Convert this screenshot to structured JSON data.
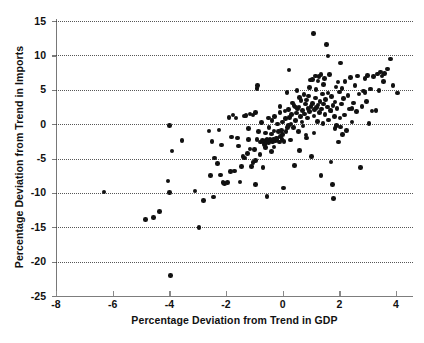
{
  "figure": {
    "background": "#ffffff",
    "ink_color": "#111111",
    "axis_color": "#7a7a7a",
    "grid_color": "#3a3a3a"
  },
  "chart_data": {
    "type": "scatter",
    "title": "",
    "xlabel": "Percentage Deviation from Trend in GDP",
    "ylabel": "Percentage Deviation from Trend in Imports",
    "xlim": [
      -8,
      4.6
    ],
    "ylim": [
      -25,
      15
    ],
    "xticks": [
      -8,
      -6,
      -4,
      -2,
      0,
      2,
      4
    ],
    "xtick_labels": [
      "-8",
      "-6",
      "-4",
      "-2",
      "0",
      "2",
      "4"
    ],
    "yticks": [
      15,
      10,
      5,
      0,
      -5,
      -10,
      -15,
      -20,
      -25
    ],
    "ytick_labels": [
      "15",
      "10",
      "5",
      "0",
      "-5",
      "-10",
      "-15",
      "-20",
      "-25"
    ],
    "grid": "horizontal-dotted",
    "gridlines_y": [
      15,
      10,
      5,
      0,
      -5,
      -10,
      -15,
      -20
    ],
    "legend": null,
    "marker": "filled-circle",
    "marker_color": "#111111",
    "n_points": 223,
    "points": [
      [
        -6.3,
        -9.9
      ],
      [
        -4.85,
        -13.9
      ],
      [
        -4.55,
        -13.6
      ],
      [
        -4.35,
        -12.7
      ],
      [
        -4.05,
        -8.3
      ],
      [
        -4.0,
        -0.2
      ],
      [
        -4.0,
        -9.95
      ],
      [
        -3.95,
        -22.0
      ],
      [
        -3.9,
        -3.9
      ],
      [
        -3.55,
        -2.4
      ],
      [
        -3.1,
        -9.7
      ],
      [
        -2.95,
        -15.0
      ],
      [
        -2.8,
        -11.1
      ],
      [
        -2.6,
        -1.0
      ],
      [
        -2.55,
        -7.5
      ],
      [
        -2.5,
        -2.5
      ],
      [
        -2.45,
        -10.6
      ],
      [
        -2.3,
        -5.7
      ],
      [
        -2.25,
        -0.85
      ],
      [
        -2.2,
        -7.4
      ],
      [
        -2.15,
        -3.05
      ],
      [
        -2.1,
        -8.5
      ],
      [
        -2.05,
        -8.6
      ],
      [
        -1.95,
        -8.5
      ],
      [
        -1.85,
        -6.9
      ],
      [
        -1.8,
        -1.85
      ],
      [
        -1.75,
        1.3
      ],
      [
        -1.7,
        -6.8
      ],
      [
        -1.65,
        0.9
      ],
      [
        -1.55,
        -3.2
      ],
      [
        -1.5,
        -8.4
      ],
      [
        -1.45,
        -6.2
      ],
      [
        -1.4,
        -4.7
      ],
      [
        -1.35,
        1.2
      ],
      [
        -1.3,
        1.25
      ],
      [
        -1.25,
        -4.3
      ],
      [
        -1.2,
        -0.6
      ],
      [
        -1.2,
        -2.2
      ],
      [
        -1.15,
        1.5
      ],
      [
        -1.1,
        -6.2
      ],
      [
        -1.05,
        1.35
      ],
      [
        -1.0,
        -3.7
      ],
      [
        -0.95,
        -8.8
      ],
      [
        -0.95,
        1.65
      ],
      [
        -0.9,
        -2.2
      ],
      [
        -0.9,
        5.2
      ],
      [
        -0.88,
        5.6
      ],
      [
        -0.85,
        -1.1
      ],
      [
        -0.8,
        -4.4
      ],
      [
        -0.78,
        -2.6
      ],
      [
        -0.75,
        0.2
      ],
      [
        -0.72,
        -2.4
      ],
      [
        -0.7,
        -6.3
      ],
      [
        -0.68,
        -2.55
      ],
      [
        -0.65,
        -3.0
      ],
      [
        -0.62,
        -2.9
      ],
      [
        -0.6,
        -1.3
      ],
      [
        -0.58,
        -2.3
      ],
      [
        -0.55,
        -10.5
      ],
      [
        -0.55,
        -2.2
      ],
      [
        -0.5,
        -2.7
      ],
      [
        -0.48,
        -0.5
      ],
      [
        -0.45,
        -2.15
      ],
      [
        -0.42,
        -2.4
      ],
      [
        -0.4,
        -1.45
      ],
      [
        -0.38,
        0.5
      ],
      [
        -0.35,
        -2.6
      ],
      [
        -0.32,
        -2.2
      ],
      [
        -0.3,
        -1.0
      ],
      [
        -0.28,
        1.1
      ],
      [
        -0.25,
        -2.4
      ],
      [
        -0.22,
        -2.0
      ],
      [
        -0.2,
        -2.2
      ],
      [
        -0.18,
        0.0
      ],
      [
        -0.15,
        -1.1
      ],
      [
        -0.12,
        -2.6
      ],
      [
        -0.1,
        2.6
      ],
      [
        -0.08,
        -1.8
      ],
      [
        -0.05,
        -0.9
      ],
      [
        -0.02,
        -2.2
      ],
      [
        0.0,
        -1.55
      ],
      [
        0.0,
        0.3
      ],
      [
        0.02,
        -9.3
      ],
      [
        0.05,
        -2.5
      ],
      [
        0.08,
        1.9
      ],
      [
        0.1,
        0.8
      ],
      [
        0.12,
        -1.1
      ],
      [
        0.15,
        4.6
      ],
      [
        0.18,
        -0.45
      ],
      [
        0.2,
        2.1
      ],
      [
        0.22,
        7.9
      ],
      [
        0.25,
        1.0
      ],
      [
        0.28,
        -2.3
      ],
      [
        0.3,
        0.0
      ],
      [
        0.32,
        1.4
      ],
      [
        0.35,
        3.1
      ],
      [
        0.38,
        -0.5
      ],
      [
        0.4,
        2.7
      ],
      [
        0.42,
        -6.0
      ],
      [
        0.45,
        0.55
      ],
      [
        0.48,
        1.6
      ],
      [
        0.5,
        4.9
      ],
      [
        0.52,
        2.2
      ],
      [
        0.55,
        -1.1
      ],
      [
        0.58,
        2.5
      ],
      [
        0.6,
        -3.8
      ],
      [
        0.62,
        1.15
      ],
      [
        0.65,
        3.4
      ],
      [
        0.68,
        0.3
      ],
      [
        0.7,
        2.0
      ],
      [
        0.72,
        -0.3
      ],
      [
        0.75,
        4.3
      ],
      [
        0.78,
        1.5
      ],
      [
        0.8,
        2.9
      ],
      [
        0.82,
        -1.6
      ],
      [
        0.85,
        3.5
      ],
      [
        0.88,
        0.9
      ],
      [
        0.9,
        2.3
      ],
      [
        0.92,
        4.1
      ],
      [
        0.95,
        1.8
      ],
      [
        0.98,
        6.4
      ],
      [
        1.0,
        2.6
      ],
      [
        1.02,
        -4.7
      ],
      [
        1.05,
        3.0
      ],
      [
        1.08,
        13.2
      ],
      [
        1.1,
        1.2
      ],
      [
        1.12,
        2.1
      ],
      [
        1.15,
        3.8
      ],
      [
        1.18,
        5.0
      ],
      [
        1.2,
        2.4
      ],
      [
        1.22,
        0.4
      ],
      [
        1.25,
        2.8
      ],
      [
        1.28,
        6.9
      ],
      [
        1.3,
        1.7
      ],
      [
        1.32,
        3.3
      ],
      [
        1.35,
        -7.5
      ],
      [
        1.38,
        2.2
      ],
      [
        1.4,
        4.4
      ],
      [
        1.42,
        0.1
      ],
      [
        1.45,
        2.9
      ],
      [
        1.48,
        6.6
      ],
      [
        1.5,
        1.4
      ],
      [
        1.52,
        3.6
      ],
      [
        1.55,
        11.6
      ],
      [
        1.58,
        2.5
      ],
      [
        1.6,
        9.9
      ],
      [
        1.62,
        0.6
      ],
      [
        1.65,
        7.2
      ],
      [
        1.68,
        2.0
      ],
      [
        1.7,
        -5.5
      ],
      [
        1.72,
        4.0
      ],
      [
        1.75,
        -8.8
      ],
      [
        1.78,
        2.7
      ],
      [
        1.8,
        -10.8
      ],
      [
        1.82,
        1.1
      ],
      [
        1.85,
        3.2
      ],
      [
        1.88,
        5.4
      ],
      [
        1.9,
        -0.2
      ],
      [
        1.92,
        2.3
      ],
      [
        1.95,
        6.1
      ],
      [
        1.98,
        -2.6
      ],
      [
        2.0,
        4.7
      ],
      [
        2.02,
        0.9
      ],
      [
        2.05,
        8.9
      ],
      [
        2.08,
        2.9
      ],
      [
        2.1,
        5.2
      ],
      [
        2.12,
        -1.5
      ],
      [
        2.15,
        3.7
      ],
      [
        2.18,
        1.3
      ],
      [
        2.2,
        6.2
      ],
      [
        2.25,
        -0.9
      ],
      [
        2.3,
        4.2
      ],
      [
        2.35,
        2.2
      ],
      [
        2.4,
        6.8
      ],
      [
        2.45,
        0.3
      ],
      [
        2.5,
        3.1
      ],
      [
        2.55,
        5.6
      ],
      [
        2.6,
        1.8
      ],
      [
        2.65,
        7.0
      ],
      [
        2.7,
        4.4
      ],
      [
        2.75,
        -6.3
      ],
      [
        2.8,
        2.6
      ],
      [
        2.85,
        4.8
      ],
      [
        2.9,
        6.6
      ],
      [
        2.95,
        3.3
      ],
      [
        3.0,
        7.1
      ],
      [
        3.1,
        5.1
      ],
      [
        3.15,
        1.9
      ],
      [
        3.2,
        6.9
      ],
      [
        3.3,
        2.0
      ],
      [
        3.35,
        7.3
      ],
      [
        3.4,
        4.9
      ],
      [
        3.5,
        7.0
      ],
      [
        3.55,
        6.2
      ],
      [
        3.6,
        7.4
      ],
      [
        3.7,
        8.0
      ],
      [
        3.8,
        9.5
      ],
      [
        3.9,
        5.6
      ],
      [
        4.05,
        4.5
      ],
      [
        3.05,
        0.1
      ],
      [
        2.9,
        4.6
      ],
      [
        1.05,
        6.5
      ],
      [
        1.15,
        7.0
      ],
      [
        1.35,
        7.2
      ],
      [
        1.25,
        6.3
      ],
      [
        0.95,
        5.3
      ],
      [
        1.45,
        5.8
      ],
      [
        1.6,
        4.5
      ],
      [
        1.7,
        1.9
      ],
      [
        1.85,
        -0.6
      ],
      [
        2.05,
        -0.4
      ],
      [
        0.6,
        3.9
      ],
      [
        0.45,
        2.5
      ],
      [
        0.2,
        -0.2
      ],
      [
        -0.3,
        -3.3
      ],
      [
        -0.6,
        -3.4
      ],
      [
        -1.6,
        -2.0
      ],
      [
        -1.9,
        1.0
      ],
      [
        -2.4,
        -4.9
      ],
      [
        -0.95,
        -5.3
      ],
      [
        -1.05,
        -5.6
      ],
      [
        -1.35,
        -4.9
      ],
      [
        -1.15,
        -3.6
      ],
      [
        -0.4,
        -4.0
      ],
      [
        1.1,
        -1.3
      ],
      [
        0.85,
        -2.0
      ],
      [
        -0.1,
        1.7
      ],
      [
        -0.5,
        0.9
      ],
      [
        2.45,
        2.3
      ],
      [
        3.45,
        7.6
      ]
    ]
  },
  "caption_fragment": ""
}
